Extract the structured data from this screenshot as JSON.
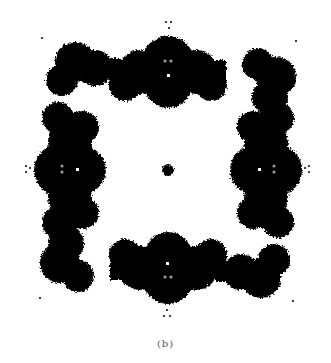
{
  "figure": {
    "kind": "fractal-julia-set",
    "symmetry": "4-fold",
    "colors": {
      "fill": "#000000",
      "background": "#ffffff",
      "sparkle": "#9a9a9a"
    },
    "caption": "(b)"
  }
}
